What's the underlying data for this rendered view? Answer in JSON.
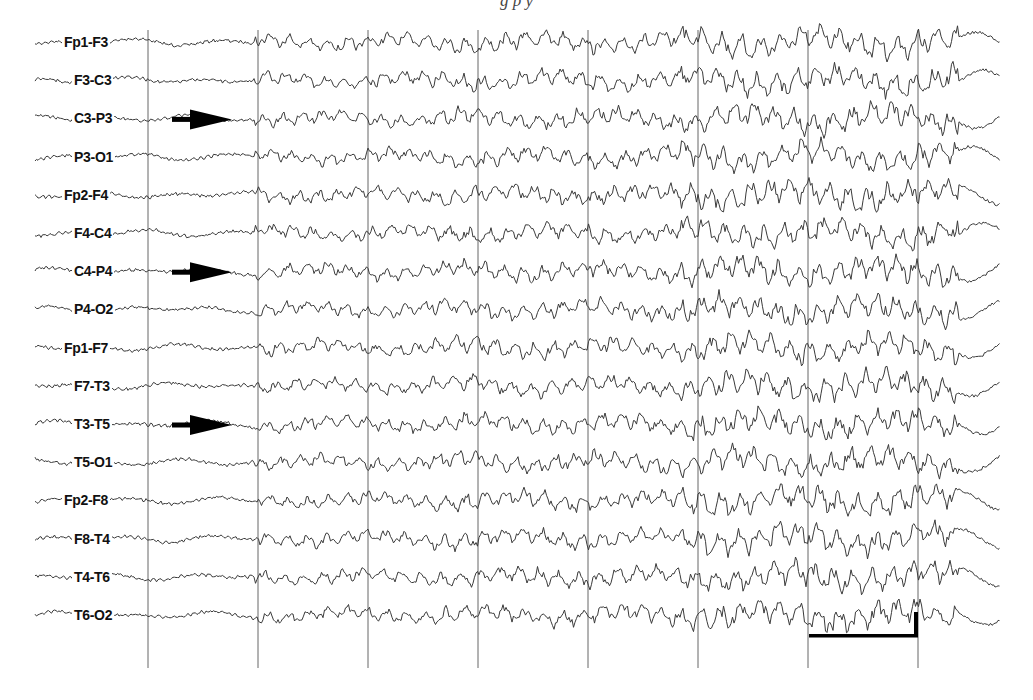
{
  "figure": {
    "caption_partial": "g    p  y",
    "trace_color": "#3a3a3a",
    "grid_color": "#555555",
    "annotation_color": "#000000"
  },
  "channels": [
    {
      "label": "Fp1-F3"
    },
    {
      "label": "F3-C3"
    },
    {
      "label": "C3-P3"
    },
    {
      "label": "P3-O1"
    },
    {
      "label": "Fp2-F4"
    },
    {
      "label": "F4-C4"
    },
    {
      "label": "C4-P4"
    },
    {
      "label": "P4-O2"
    },
    {
      "label": "Fp1-F7"
    },
    {
      "label": "F7-T3"
    },
    {
      "label": "T3-T5"
    },
    {
      "label": "T5-O1"
    },
    {
      "label": "Fp2-F8"
    },
    {
      "label": "F8-T4"
    },
    {
      "label": "T4-T6"
    },
    {
      "label": "T6-O2"
    }
  ],
  "annotations": {
    "arrows": [
      {
        "channel": "C3-P3",
        "direction": "right"
      },
      {
        "channel": "C4-P4",
        "direction": "right"
      },
      {
        "channel": "T3-T5",
        "direction": "right"
      }
    ],
    "calibration_bar": {
      "present": true,
      "position": "bottom-right"
    }
  },
  "grid": {
    "vertical_lines_x": [
      148,
      258,
      368,
      478,
      588,
      698,
      808,
      918
    ]
  }
}
